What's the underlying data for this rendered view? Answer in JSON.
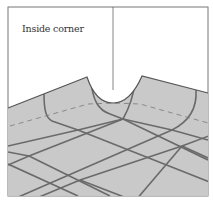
{
  "figure": {
    "label": "Inside corner",
    "colors": {
      "floor": "#c9c9c9",
      "grout": "#6a6a6a",
      "outline": "#555555",
      "wall": "#ffffff",
      "dashed": "#7a7a7a"
    }
  }
}
